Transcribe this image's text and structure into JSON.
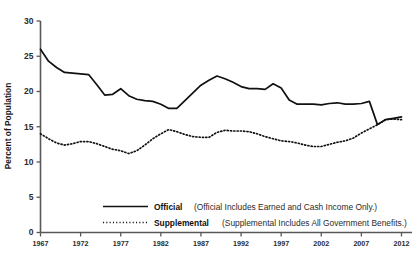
{
  "chart_data": {
    "type": "line",
    "title": "",
    "subtitle": "",
    "xlabel": "",
    "ylabel": "Percent of Population",
    "xlim": [
      1967,
      2012
    ],
    "ylim": [
      0,
      30
    ],
    "grid": false,
    "legend_position": "bottom",
    "x_tick_labels": [
      "1967",
      "1972",
      "1977",
      "1982",
      "1987",
      "1992",
      "1997",
      "2002",
      "2007",
      "2012"
    ],
    "y_tick_labels": [
      "0",
      "5",
      "10",
      "15",
      "20",
      "25",
      "30"
    ],
    "x": [
      1967,
      1968,
      1969,
      1970,
      1971,
      1972,
      1973,
      1974,
      1975,
      1976,
      1977,
      1978,
      1979,
      1980,
      1981,
      1982,
      1983,
      1984,
      1985,
      1986,
      1987,
      1988,
      1989,
      1990,
      1991,
      1992,
      1993,
      1994,
      1995,
      1996,
      1997,
      1998,
      1999,
      2000,
      2001,
      2002,
      2003,
      2004,
      2005,
      2006,
      2007,
      2008,
      2009,
      2010,
      2011,
      2012
    ],
    "series": [
      {
        "name": "Official",
        "description": "(Official Includes Earned and Cash Income Only.)",
        "style": "solid",
        "values": [
          26.0,
          24.3,
          23.4,
          22.7,
          22.6,
          22.5,
          22.4,
          21.0,
          19.5,
          19.6,
          20.4,
          19.4,
          18.9,
          18.7,
          18.6,
          18.2,
          17.6,
          17.6,
          18.7,
          19.8,
          20.9,
          21.6,
          22.2,
          21.8,
          21.3,
          20.7,
          20.4,
          20.4,
          20.3,
          21.1,
          20.5,
          18.8,
          18.2,
          18.2,
          18.2,
          18.1,
          18.3,
          18.4,
          18.2,
          18.2,
          18.3,
          18.6,
          15.3,
          16.0,
          16.2,
          16.4
        ]
      },
      {
        "name": "Supplemental",
        "description": "(Supplemental Includes All Government Benefits.)",
        "style": "dotted",
        "values": [
          14.0,
          13.3,
          12.7,
          12.4,
          12.6,
          12.9,
          12.9,
          12.6,
          12.2,
          11.8,
          11.6,
          11.2,
          11.6,
          12.4,
          13.3,
          14.0,
          14.6,
          14.3,
          13.9,
          13.6,
          13.5,
          13.5,
          14.2,
          14.5,
          14.4,
          14.4,
          14.3,
          14.0,
          13.6,
          13.3,
          13.0,
          12.9,
          12.7,
          12.4,
          12.2,
          12.2,
          12.5,
          12.8,
          13.0,
          13.4,
          14.1,
          14.7,
          15.3,
          16.0,
          16.1,
          16.0
        ]
      }
    ]
  },
  "axes": {
    "y_title": "Percent of Population"
  },
  "legend": {
    "items": [
      {
        "name": "Official",
        "description": "(Official Includes Earned and Cash Income Only.)"
      },
      {
        "name": "Supplemental",
        "description": "(Supplemental Includes All Government Benefits.)"
      }
    ]
  },
  "colors": {
    "line": "#111111",
    "axis": "#58585a",
    "text": "#1a1a1a",
    "background": "#ffffff"
  }
}
